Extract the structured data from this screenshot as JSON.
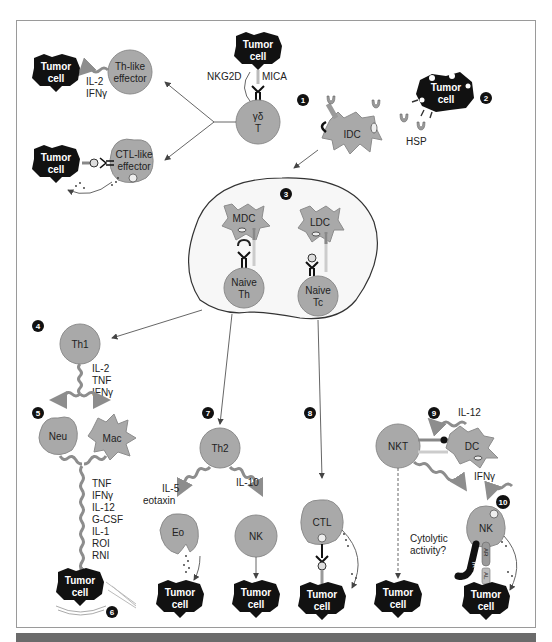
{
  "figure": {
    "numbers": [
      "1",
      "2",
      "3",
      "4",
      "5",
      "6",
      "7",
      "8",
      "9",
      "10"
    ],
    "colors": {
      "cell": "#a9a9a9",
      "tumor": "#111111",
      "frame": "#9a9a9a",
      "badge": "#111111"
    }
  },
  "panel1": {
    "tumor_top": [
      "Tumor",
      "cell"
    ],
    "receptor": "NKG2D",
    "ligand": "MICA",
    "gd_cell": [
      "γδ",
      "T"
    ],
    "th_like": [
      "Th-like",
      "effector"
    ],
    "th_cytokines": [
      "IL-2",
      "IFNγ"
    ],
    "ctl_like": [
      "CTL-like",
      "effector"
    ],
    "tumor_left_top": [
      "Tumor",
      "cell"
    ],
    "tumor_left_bottom": [
      "Tumor",
      "cell"
    ]
  },
  "panel2": {
    "tumor": [
      "Tumor",
      "cell"
    ],
    "hsp": "HSP",
    "idc": "IDC"
  },
  "panel3": {
    "mdc": "MDC",
    "ldc": "LDC",
    "naive_th": [
      "Naive",
      "Th"
    ],
    "naive_tc": [
      "Naive",
      "Tc"
    ]
  },
  "panel4_5_6": {
    "th1": "Th1",
    "th1_cytokines": [
      "IL-2",
      "TNF",
      "IFNγ"
    ],
    "neu": "Neu",
    "mac": "Mac",
    "effector_molecules": [
      "TNF",
      "IFNγ",
      "IL-12",
      "G-CSF",
      "IL-1",
      "ROI",
      "RNI"
    ],
    "tumor": [
      "Tumor",
      "cell"
    ]
  },
  "panel7": {
    "th2": "Th2",
    "left_cytokines": [
      "IL-5",
      "eotaxin"
    ],
    "right_cytokine": "IL-10",
    "eo": "Eo",
    "nk": "NK",
    "tumor_eo": [
      "Tumor",
      "cell"
    ],
    "tumor_nk": [
      "Tumor",
      "cell"
    ]
  },
  "panel8": {
    "ctl": "CTL",
    "tumor": [
      "Tumor",
      "cell"
    ]
  },
  "panel9_10": {
    "il12": "IL-12",
    "nkt": "NKT",
    "dc": "DC",
    "ifng": "IFNγ",
    "question": [
      "Cytolytic",
      "activity?"
    ],
    "nk": "NK",
    "ir": "IR",
    "ar": "AR",
    "al": "AL",
    "tumor_nkt": [
      "Tumor",
      "cell"
    ],
    "tumor_nk": [
      "Tumor",
      "cell"
    ]
  }
}
